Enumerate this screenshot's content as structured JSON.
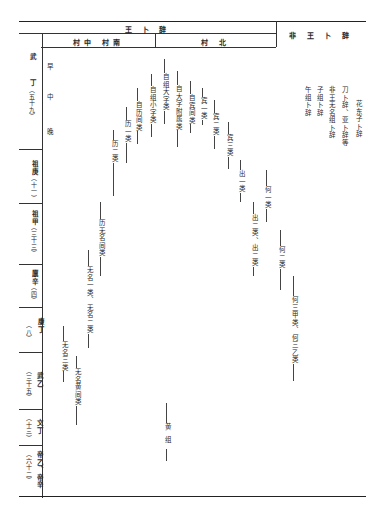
{
  "header": {
    "royal": "王 卜 辞",
    "village_south_middle": "村中 村南",
    "village_north": "村 北",
    "non_royal": "非 王 卜 辞"
  },
  "periods": [
    {
      "king": "武",
      "sub": "丁",
      "count": "（五十九）",
      "phases": [
        "早",
        "中",
        "晚"
      ]
    },
    {
      "king": "祖庚",
      "count": "（十一）"
    },
    {
      "king": "祖甲",
      "count": "（三十三）"
    },
    {
      "king": "廪辛",
      "count": "（四）"
    },
    {
      "king": "康丁",
      "count": "（八）"
    },
    {
      "king": "武乙",
      "count": "（三十五）"
    },
    {
      "king": "文丁",
      "count": "（十三）"
    },
    {
      "king": "帝乙、帝辛",
      "count": "（六十二）"
    }
  ],
  "groups": [
    {
      "label": "历二类",
      "x": 113,
      "top": 130,
      "bottom": 196
    },
    {
      "label": "历一类",
      "x": 126,
      "top": 107,
      "bottom": 163
    },
    {
      "label": "自历间类",
      "x": 137,
      "top": 88,
      "bottom": 144
    },
    {
      "label": "自组小字类",
      "x": 151,
      "top": 74,
      "bottom": 137
    },
    {
      "label": "自组大字类",
      "x": 164,
      "top": 59,
      "bottom": 124
    },
    {
      "label": "自大字附属类",
      "x": 177,
      "top": 71,
      "bottom": 147
    },
    {
      "label": "自宾间类",
      "x": 190,
      "top": 81,
      "bottom": 133
    },
    {
      "label": "宾一类",
      "x": 202,
      "top": 88,
      "bottom": 125
    },
    {
      "label": "宾二类",
      "x": 214,
      "top": 100,
      "bottom": 149
    },
    {
      "label": "宾三类",
      "x": 228,
      "top": 122,
      "bottom": 169
    },
    {
      "label": "出一类",
      "x": 240,
      "top": 160,
      "bottom": 202
    },
    {
      "label": "何一类",
      "x": 266,
      "top": 170,
      "bottom": 222
    },
    {
      "label": "出二类、出二类",
      "x": 253,
      "top": 202,
      "bottom": 276
    },
    {
      "label": "何二类",
      "x": 280,
      "top": 230,
      "bottom": 290
    },
    {
      "label": "何三甲类、何三乙类",
      "x": 293,
      "top": 276,
      "bottom": 381
    },
    {
      "label": "历无名间类",
      "x": 100,
      "top": 202,
      "bottom": 276
    },
    {
      "label": "无名一类、无名二类",
      "x": 88,
      "top": 250,
      "bottom": 348
    },
    {
      "label": "无名三类",
      "x": 63,
      "top": 326,
      "bottom": 382
    },
    {
      "label": "无名黄间类",
      "x": 76,
      "top": 356,
      "bottom": 425
    },
    {
      "label": "黄组",
      "x": 166,
      "top": 403,
      "bottom": 461
    }
  ],
  "non_royal_groups": [
    {
      "label": "花东子卜辞",
      "x": 357,
      "top": 100
    },
    {
      "label": "刀卜辞、亚卜辞等",
      "x": 343,
      "top": 86
    },
    {
      "label": "非王无名组卜辞",
      "x": 330,
      "top": 86
    },
    {
      "label": "子组卜辞",
      "x": 318,
      "top": 86
    },
    {
      "label": "午组卜辞",
      "x": 306,
      "top": 86
    }
  ]
}
